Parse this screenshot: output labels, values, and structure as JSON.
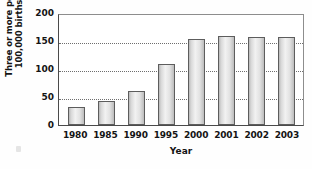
{
  "chart_data": {
    "type": "bar",
    "title": "",
    "xlabel": "Year",
    "ylabel_lines": [
      "Three or more per",
      "100,000 births"
    ],
    "categories": [
      "1980",
      "1985",
      "1990",
      "1995",
      "2000",
      "2001",
      "2002",
      "2003"
    ],
    "values": [
      33,
      45,
      62,
      112,
      159,
      163,
      161,
      162
    ],
    "ylim": [
      0,
      200
    ],
    "yticks": [
      200,
      150,
      100,
      50,
      0
    ],
    "ytick_labels": [
      "200",
      "150",
      "100",
      "50",
      "0"
    ],
    "gridlines": [
      150,
      100,
      50
    ],
    "grid": true,
    "legend": null,
    "series_name": "Three or more per 100,000 births",
    "colors": {
      "bar_fill_light": "#f2f2f2",
      "bar_fill_dark": "#bcbcbc",
      "bar_border": "#5d5d5d",
      "axis": "#4a4a4a",
      "gridline": "#6e6e6e",
      "text": "#141414",
      "background": "#ffffff"
    }
  }
}
